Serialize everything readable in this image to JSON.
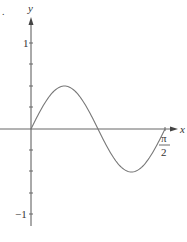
{
  "chart_data": {
    "type": "line",
    "title": "",
    "xlabel": "x",
    "ylabel": "y",
    "function": "y = 0.5 sin(4x)",
    "x_range": [
      0,
      1.5708
    ],
    "ylim": [
      -1.2,
      1.3
    ],
    "x_ticks": [
      {
        "value": 1.5708,
        "label_num": "π",
        "label_den": "2"
      }
    ],
    "y_ticks": [
      -1,
      -0.75,
      -0.5,
      -0.25,
      0.25,
      0.5,
      0.75,
      1
    ],
    "y_tick_labels": [
      {
        "value": 1,
        "label": "1"
      },
      {
        "value": -1,
        "label": "−1"
      }
    ],
    "series": [
      {
        "name": "curve",
        "x": [
          0,
          0.3927,
          0.7854,
          1.1781,
          1.5708
        ],
        "y": [
          0,
          0.5,
          0,
          -0.5,
          0
        ]
      }
    ],
    "grid": false,
    "legend": null
  },
  "labels": {
    "x_axis": "x",
    "y_axis": "y",
    "y_one": "1",
    "y_neg_one": "−1",
    "pi": "π",
    "two": "2",
    "corner_mark": "."
  },
  "colors": {
    "axis": "#555555",
    "curve": "#777777",
    "text": "#333333"
  }
}
